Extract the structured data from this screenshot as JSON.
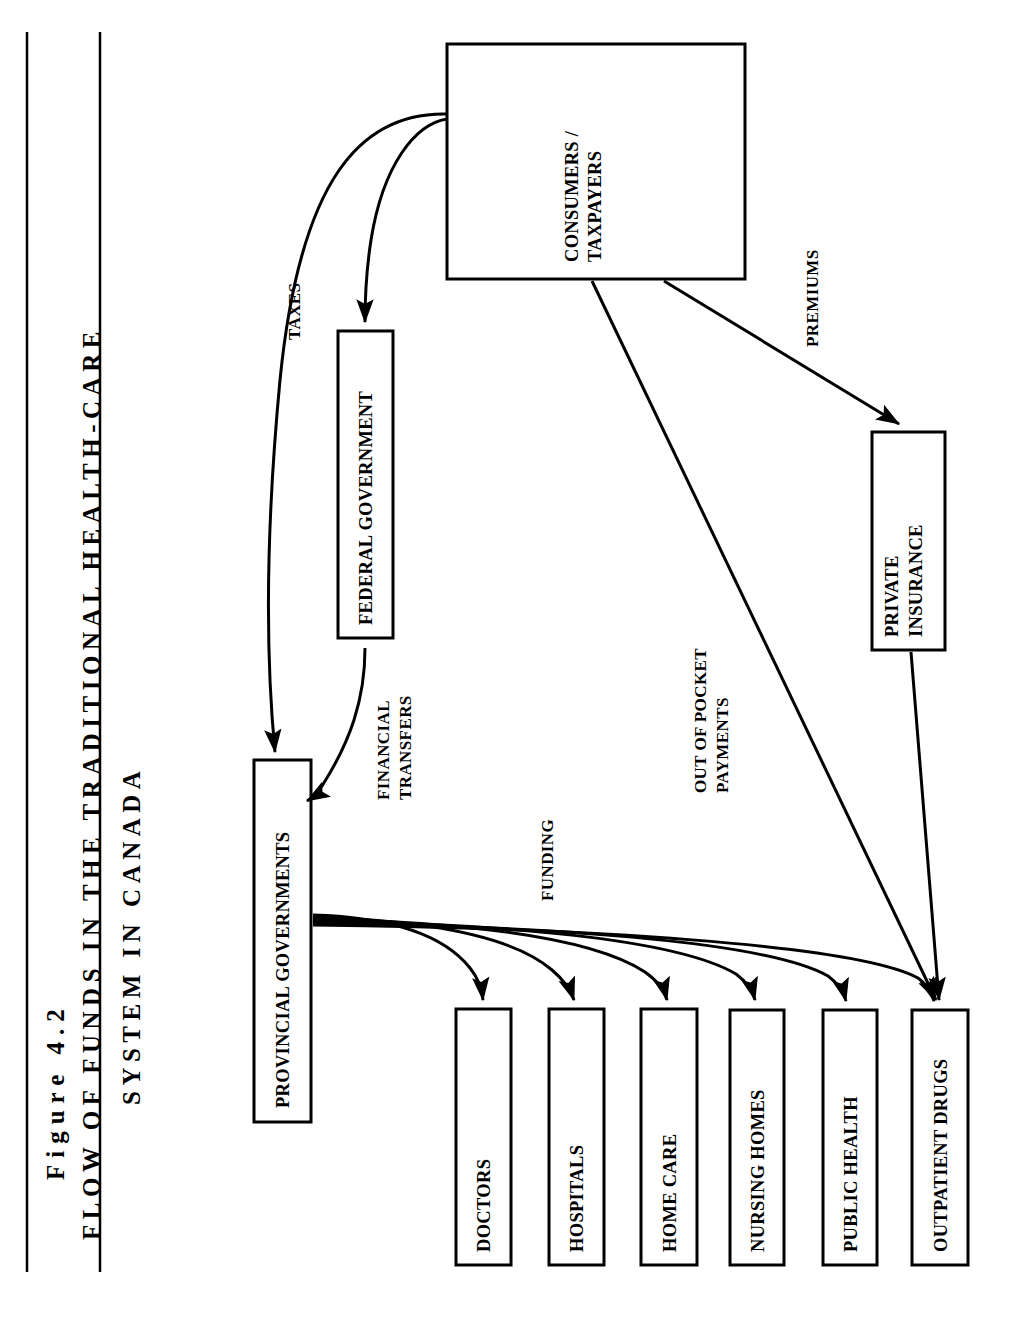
{
  "figure": {
    "number_label": "Figure  4.2",
    "title_line1": "FLOW OF FUNDS IN THE TRADITIONAL HEALTH-CARE",
    "title_line2": "SYSTEM IN CANADA"
  },
  "colors": {
    "ink": "#000000",
    "paper": "#ffffff"
  },
  "nodes": [
    {
      "id": "consumers",
      "label_line1": "CONSUMERS /",
      "label_line2": "TAXPAYERS"
    },
    {
      "id": "federal",
      "label_line1": "FEDERAL GOVERNMENT",
      "label_line2": ""
    },
    {
      "id": "provincial",
      "label_line1": "PROVINCIAL GOVERNMENTS",
      "label_line2": ""
    },
    {
      "id": "insurance",
      "label_line1": "PRIVATE",
      "label_line2": "INSURANCE"
    },
    {
      "id": "doctors",
      "label_line1": "DOCTORS",
      "label_line2": ""
    },
    {
      "id": "hospitals",
      "label_line1": "HOSPITALS",
      "label_line2": ""
    },
    {
      "id": "homecare",
      "label_line1": "HOME CARE",
      "label_line2": ""
    },
    {
      "id": "nursing",
      "label_line1": "NURSING HOMES",
      "label_line2": ""
    },
    {
      "id": "publichealth",
      "label_line1": "PUBLIC HEALTH",
      "label_line2": ""
    },
    {
      "id": "drugs",
      "label_line1": "OUTPATIENT DRUGS",
      "label_line2": ""
    }
  ],
  "flow_labels": [
    {
      "id": "taxes",
      "line1": "TAXES",
      "line2": ""
    },
    {
      "id": "transfers",
      "line1": "FINANCIAL",
      "line2": "TRANSFERS"
    },
    {
      "id": "premiums",
      "line1": "PREMIUMS",
      "line2": ""
    },
    {
      "id": "outofpocket",
      "line1": "OUT OF POCKET",
      "line2": "PAYMENTS"
    },
    {
      "id": "funding",
      "line1": "FUNDING",
      "line2": ""
    }
  ]
}
